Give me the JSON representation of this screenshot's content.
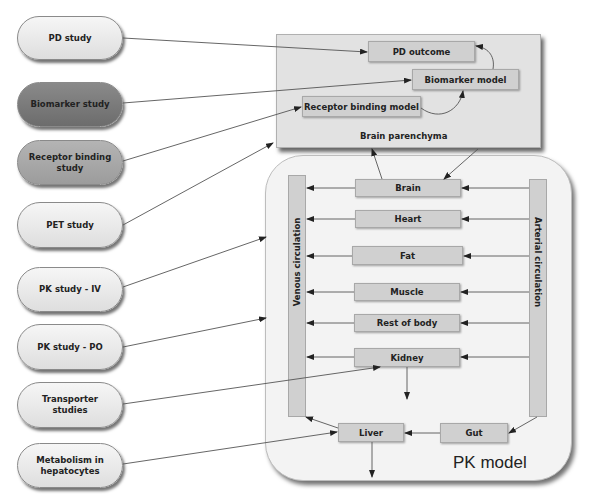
{
  "studies": [
    {
      "label": "PD study",
      "shade": "light"
    },
    {
      "label": "Biomarker study",
      "shade": "dark"
    },
    {
      "label": "Receptor binding study",
      "shade": "mid"
    },
    {
      "label": "PET study",
      "shade": "light"
    },
    {
      "label": "PK study - IV",
      "shade": "light"
    },
    {
      "label": "PK study - PO",
      "shade": "light"
    },
    {
      "label": "Transporter studies",
      "shade": "light"
    },
    {
      "label": "Metabolism in hepatocytes",
      "shade": "light"
    }
  ],
  "brain_panel": {
    "title": "Brain parenchyma",
    "boxes": {
      "pd_outcome": "PD outcome",
      "biomarker_model": "Biomarker model",
      "receptor_binding_model": "Receptor binding model"
    }
  },
  "pk_panel": {
    "title": "PK model",
    "venous_label": "Venous circulation",
    "arterial_label": "Arterial circulation",
    "organs": {
      "brain": "Brain",
      "heart": "Heart",
      "fat": "Fat",
      "muscle": "Muscle",
      "rest_of_body": "Rest of body",
      "kidney": "Kidney",
      "liver": "Liver",
      "gut": "Gut"
    }
  },
  "colors": {
    "pill_light": "#e8e8e8",
    "pill_dark": "#7a7a7a",
    "pill_mid": "#a8a8a8",
    "box_fill": "#d0d0d0",
    "panel_brain": "#e2e2e2",
    "panel_pk": "#f3f3f3",
    "arrow": "#333333"
  }
}
